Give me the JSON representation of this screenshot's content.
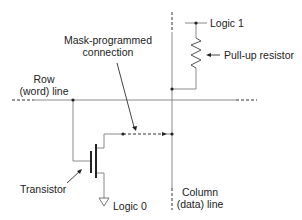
{
  "diagram": {
    "labels": {
      "logic1": "Logic 1",
      "pullup": "Pull-up resistor",
      "mask_line1": "Mask-programmed",
      "mask_line2": "connection",
      "row_line1": "Row",
      "row_line2": "(word) line",
      "transistor": "Transistor",
      "logic0": "Logic 0",
      "column_line1": "Column",
      "column_line2": "(data) line"
    },
    "colors": {
      "wire": "#8a8a8a",
      "dark": "#222222",
      "text": "#222222"
    }
  }
}
